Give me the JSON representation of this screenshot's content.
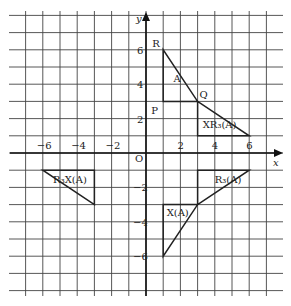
{
  "diagram": {
    "axes": {
      "x_label": "x",
      "y_label": "y",
      "origin_label": "O",
      "x_ticks": [
        "−6",
        "−4",
        "−2",
        "2",
        "4",
        "6"
      ],
      "x_tick_values": [
        -6,
        -4,
        -2,
        2,
        4,
        6
      ],
      "y_ticks": [
        "6",
        "4",
        "2",
        "−2",
        "−4",
        "−6"
      ],
      "y_tick_values": [
        6,
        4,
        2,
        -2,
        -4,
        -6
      ]
    },
    "shapes": [
      {
        "name": "A",
        "label": "A",
        "vertices": [
          [
            1,
            6
          ],
          [
            1,
            3
          ],
          [
            3,
            3
          ]
        ]
      },
      {
        "name": "XR3(A)",
        "label": "XR₃(A)",
        "vertices": [
          [
            3,
            3
          ],
          [
            3,
            1
          ],
          [
            6,
            1
          ]
        ]
      },
      {
        "name": "R3(A)",
        "label": "R₃(A)",
        "vertices": [
          [
            3,
            -1
          ],
          [
            6,
            -1
          ],
          [
            3,
            -3
          ]
        ]
      },
      {
        "name": "X(A)",
        "label": "X(A)",
        "vertices": [
          [
            1,
            -3
          ],
          [
            3,
            -3
          ],
          [
            1,
            -6
          ]
        ]
      },
      {
        "name": "R3X(A)",
        "label": "R₃X(A)",
        "vertices": [
          [
            -6,
            -1
          ],
          [
            -3,
            -1
          ],
          [
            -3,
            -3
          ]
        ]
      }
    ],
    "points": [
      {
        "label": "R",
        "x": 1,
        "y": 6
      },
      {
        "label": "P",
        "x": 1,
        "y": 3
      },
      {
        "label": "Q",
        "x": 3,
        "y": 3
      }
    ]
  }
}
